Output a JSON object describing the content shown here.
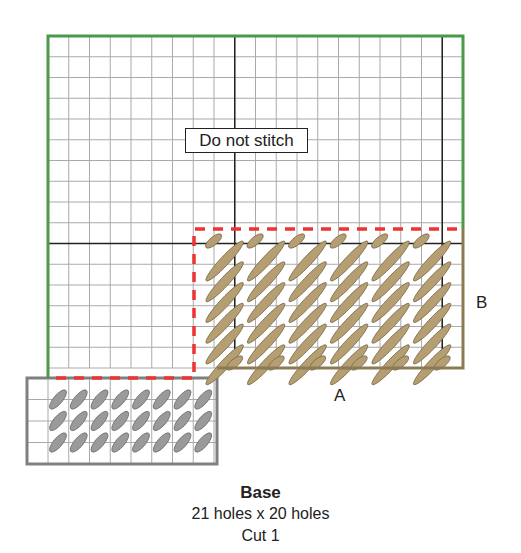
{
  "diagram": {
    "note_label": "Do not stitch",
    "edge_labels": {
      "a": "A",
      "b": "B"
    },
    "grid": {
      "origin_x": 48,
      "origin_y": 36,
      "cell": 20.75,
      "cols": 20,
      "rows": 16,
      "heavy_cols": [
        9,
        19
      ],
      "heavy_rows": [
        10
      ]
    },
    "colors": {
      "grid_line": "#aaaaaa",
      "heavy_line": "#222222",
      "unstitched_border": "#4a9a4a",
      "stitched_border": "#8c7a55",
      "tab_border": "#808080",
      "dashed_fold": "#ee3333",
      "tan_stitch": "#b59e72",
      "tan_stitch_outline": "#7a6a48",
      "gray_stitch": "#9a9a9a",
      "gray_stitch_outline": "#6e6e6e"
    },
    "tan_stitch_area": {
      "col_start": 7.5,
      "cols": 12,
      "row_start": 9,
      "rows": 7
    },
    "gray_tab": {
      "x": 27,
      "y": 378,
      "w": 190,
      "h": 86,
      "stitch_cols": 8,
      "stitch_rows": 3
    }
  },
  "caption": {
    "title": "Base",
    "size": "21 holes x 20 holes",
    "cut": "Cut 1"
  }
}
